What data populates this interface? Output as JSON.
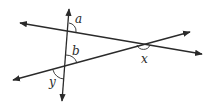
{
  "diagram": {
    "title": "",
    "type": "intersecting lines with transversal",
    "stroke_color": "#2a2a2a",
    "background": "#ffffff",
    "lines": [
      {
        "name": "transversal",
        "from": [
          69,
          9
        ],
        "to": [
          62,
          101
        ],
        "arrows": "both"
      },
      {
        "name": "upper-line",
        "from": [
          20,
          23
        ],
        "to": [
          202,
          54
        ],
        "arrows": "both"
      },
      {
        "name": "lower-line",
        "from": [
          13,
          80
        ],
        "to": [
          190,
          32
        ],
        "arrows": "both"
      }
    ],
    "intersections": {
      "top": [
        68,
        31
      ],
      "left": [
        65,
        67
      ],
      "right": [
        143,
        44
      ]
    },
    "angles": [
      {
        "label": "a",
        "vertex": "top",
        "position": "upper-right"
      },
      {
        "label": "b",
        "vertex": "left",
        "position": "upper-right"
      },
      {
        "label": "x",
        "vertex": "right",
        "position": "below"
      },
      {
        "label": "y",
        "vertex": "left",
        "position": "lower-left"
      }
    ]
  },
  "labels": {
    "a": "a",
    "b": "b",
    "x": "x",
    "y": "y"
  }
}
